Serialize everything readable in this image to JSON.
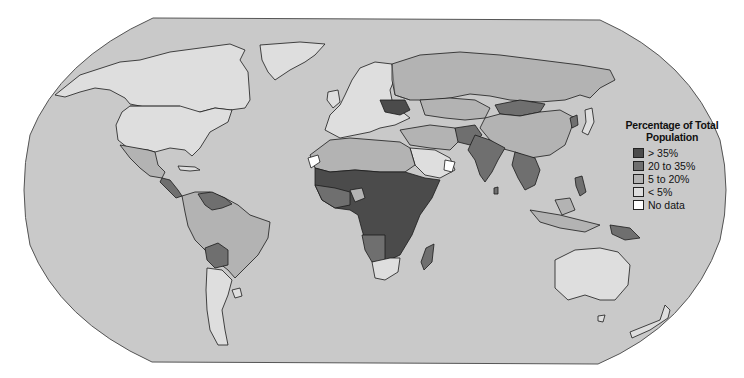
{
  "map": {
    "projection": "Robinson-like world map",
    "ocean_color": "#c9c9c9",
    "frame_stroke": "#555555"
  },
  "legend": {
    "title_line1": "Percentage of Total",
    "title_line2": "Population",
    "items": [
      {
        "label": "> 35%",
        "color": "#4b4b4b"
      },
      {
        "label": "20 to 35%",
        "color": "#6f6f6f"
      },
      {
        "label": "5 to 20%",
        "color": "#b3b3b3"
      },
      {
        "label": "< 5%",
        "color": "#dedede"
      },
      {
        "label": "No data",
        "color": "#ffffff"
      }
    ]
  },
  "regions": {
    "north_america": "< 5%",
    "greenland": "< 5%",
    "mexico": "5 to 20%",
    "central_america": "20 to 35%",
    "brazil": "5 to 20%",
    "bolivia": "20 to 35%",
    "venezuela_guyana": "20 to 35%",
    "argentina": "< 5%",
    "uruguay": "< 5%",
    "europe": "< 5%",
    "ukraine": "> 35%",
    "russia": "5 to 20%",
    "kazakhstan": "5 to 20%",
    "mongolia": "20 to 35%",
    "china": "5 to 20%",
    "afghanistan": "20 to 35%",
    "india": "20 to 35%",
    "southeast_asia": "20 to 35%",
    "north_korea": "20 to 35%",
    "japan": "< 5%",
    "philippines": "20 to 35%",
    "indonesia": "5 to 20%",
    "papua_new_guinea": "20 to 35%",
    "australia": "< 5%",
    "new_zealand": "< 5%",
    "north_africa": "5 to 20%",
    "western_sahara": "No data",
    "sub_saharan_africa": "> 35%",
    "south_africa": "< 5%",
    "madagascar": "20 to 35%",
    "arabian_peninsula": "< 5%",
    "oman": "No data"
  }
}
